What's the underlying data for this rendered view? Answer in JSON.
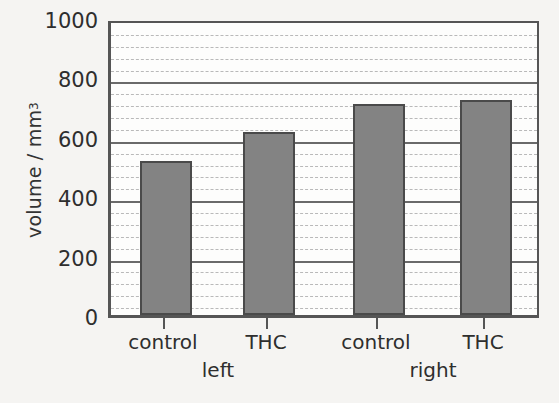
{
  "chart_data": {
    "type": "bar",
    "title": "",
    "xlabel": "",
    "ylabel": "volume / mm",
    "ylabel_exponent": "3",
    "categories": [
      "control",
      "THC",
      "control",
      "THC"
    ],
    "groups": [
      {
        "label": "left",
        "categories": [
          "control",
          "THC"
        ]
      },
      {
        "label": "right",
        "categories": [
          "control",
          "THC"
        ]
      }
    ],
    "values": [
      520,
      615,
      710,
      725
    ],
    "ylim": [
      0,
      1000
    ],
    "ytick_labels": [
      "0",
      "200",
      "400",
      "600",
      "800",
      "1000"
    ],
    "ytick_values": [
      0,
      200,
      400,
      600,
      800,
      1000
    ],
    "minor_tick_step": 40,
    "grid": true,
    "legend": "none",
    "bar_color": "#838383",
    "bar_border_color": "#4a4a4a",
    "axis_color": "#555555",
    "major_gridline_color": "#6a6a6a",
    "minor_gridline_color": "#b9b9b9",
    "background_color": "#f5f4f2",
    "plot_background_color": "#fdfdfc"
  }
}
